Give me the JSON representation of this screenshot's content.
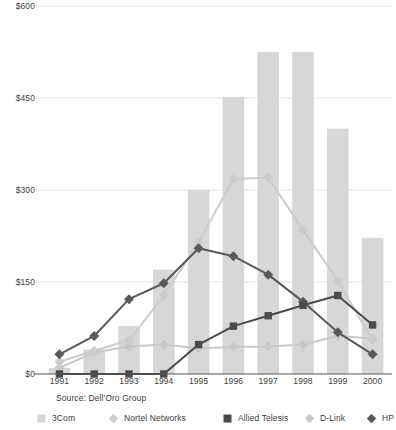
{
  "chart_data": {
    "type": "bar",
    "title": "",
    "subtitle": "",
    "xlabel": "",
    "ylabel": "",
    "categories": [
      "1991",
      "1992",
      "1993",
      "1994",
      "1995",
      "1996",
      "1997",
      "1998",
      "1999",
      "2000"
    ],
    "ylim": [
      0,
      600
    ],
    "yticks": [
      0,
      150,
      300,
      450,
      600
    ],
    "ytick_labels": [
      "$0",
      "$150",
      "$300",
      "$450",
      "$600"
    ],
    "grid": true,
    "legend_position": "bottom",
    "source": "Source: Dell'Oro Group",
    "series": [
      {
        "name": "3Com",
        "type": "bar",
        "color": "#d7d7d7",
        "marker": "square",
        "values": [
          10,
          40,
          78,
          170,
          300,
          452,
          525,
          525,
          400,
          222
        ]
      },
      {
        "name": "Nortel Networks",
        "type": "line",
        "color": "#cccccc",
        "marker": "diamond",
        "values": [
          20,
          38,
          55,
          128,
          215,
          318,
          320,
          235,
          152,
          55
        ]
      },
      {
        "name": "Allied Telesis",
        "type": "line",
        "color": "#4a4a4a",
        "marker": "square",
        "values": [
          0,
          0,
          0,
          0,
          48,
          78,
          95,
          112,
          128,
          80
        ]
      },
      {
        "name": "D-Link",
        "type": "line",
        "color": "#c9c9c9",
        "marker": "diamond",
        "values": [
          10,
          35,
          45,
          48,
          42,
          44,
          45,
          48,
          62,
          58
        ]
      },
      {
        "name": "HP",
        "type": "line",
        "color": "#595959",
        "marker": "diamond",
        "values": [
          32,
          62,
          122,
          148,
          205,
          192,
          162,
          118,
          68,
          32
        ]
      }
    ]
  },
  "legend": {
    "items": [
      {
        "label": "3Com",
        "marker": "square",
        "color": "#d7d7d7"
      },
      {
        "label": "Nortel Networks",
        "marker": "diamond",
        "color": "#cccccc"
      },
      {
        "label": "Allied Telesis",
        "marker": "square",
        "color": "#4a4a4a"
      },
      {
        "label": "D-Link",
        "marker": "diamond",
        "color": "#c9c9c9"
      },
      {
        "label": "HP",
        "marker": "diamond",
        "color": "#595959"
      }
    ]
  },
  "axis_colors": {
    "gridline": "#e3e3e3",
    "axis": "#555555",
    "text": "#3d3d3d"
  }
}
